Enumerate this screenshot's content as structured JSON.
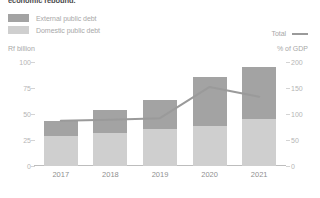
{
  "title": "economic rebound.",
  "legend": {
    "items": [
      {
        "label": "External public debt",
        "color": "#a3a3a3"
      },
      {
        "label": "Domestic public debt",
        "color": "#cfcfcf"
      }
    ],
    "total_label": "Total",
    "total_color": "#9a9a9a"
  },
  "axis": {
    "left_unit": "Rf billion",
    "right_unit": "% of GDP",
    "left_ticks": [
      "100",
      "75",
      "50",
      "25",
      "0"
    ],
    "right_ticks": [
      "200",
      "150",
      "100",
      "50",
      "0"
    ]
  },
  "chart_data": {
    "type": "bar",
    "title": "economic rebound.",
    "xlabel": "",
    "ylabel": "Rf billion",
    "y2label": "% of GDP",
    "ylim": [
      0,
      100
    ],
    "y2lim": [
      0,
      200
    ],
    "grid": false,
    "legend_position": "top-left",
    "categories": [
      "2017",
      "2018",
      "2019",
      "2020",
      "2021"
    ],
    "series": [
      {
        "name": "Domestic public debt",
        "type": "bar",
        "stack": "debt",
        "color": "#cfcfcf",
        "axis": "left",
        "values": [
          29,
          32,
          36,
          38,
          45
        ]
      },
      {
        "name": "External public debt",
        "type": "bar",
        "stack": "debt",
        "color": "#a3a3a3",
        "axis": "left",
        "values": [
          14,
          22,
          27,
          48,
          50
        ]
      },
      {
        "name": "Total",
        "type": "line",
        "color": "#9a9a9a",
        "axis": "right",
        "values": [
          87,
          89,
          92,
          152,
          133
        ]
      }
    ]
  }
}
